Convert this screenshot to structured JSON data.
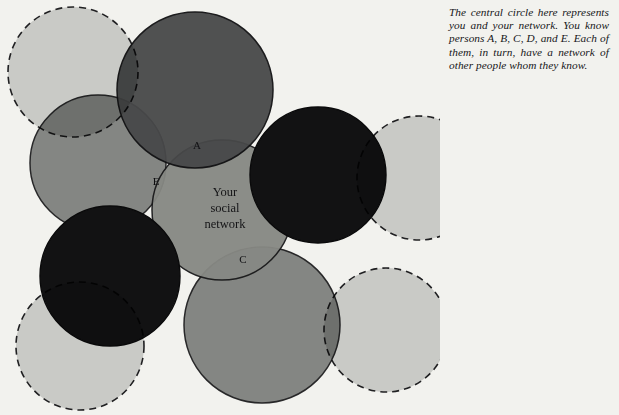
{
  "figure": {
    "caption": "The central circle here represents you and your network. You know persons A, B, C, D, and E. Each of them, in turn, have a network of other people whom they know.",
    "center_label_lines": [
      "Your",
      "social",
      "network"
    ],
    "background_color": "#f2f2ee"
  },
  "diagram": {
    "type": "venn-overlap-circles",
    "palette": {
      "light_gray": "#c9cac6",
      "medium_gray": "#838584",
      "dark_gray": "#4b4c4e",
      "black": "#121214",
      "outline": "#1a1a1c",
      "center_gray": "#8e908d"
    },
    "node_labels": [
      {
        "id": "A",
        "text": "A",
        "x": 197,
        "y": 149
      },
      {
        "id": "E",
        "text": "E",
        "x": 156,
        "y": 185
      },
      {
        "id": "C",
        "text": "C",
        "x": 243,
        "y": 263
      }
    ],
    "circles": [
      {
        "name": "outer-network-top-left",
        "cx": 73,
        "cy": 72,
        "r": 65,
        "fill": "light_gray",
        "stroke": "dashed"
      },
      {
        "name": "network-a",
        "cx": 195,
        "cy": 90,
        "r": 78,
        "fill": "dark_gray",
        "stroke": "solid"
      },
      {
        "name": "network-e",
        "cx": 98,
        "cy": 163,
        "r": 68,
        "fill": "medium_gray",
        "stroke": "solid"
      },
      {
        "name": "your-social-network",
        "cx": 222,
        "cy": 210,
        "r": 70,
        "fill": "center_gray",
        "stroke": "solid"
      },
      {
        "name": "network-b",
        "cx": 318,
        "cy": 175,
        "r": 68,
        "fill": "black",
        "stroke": "solid"
      },
      {
        "name": "network-d",
        "cx": 110,
        "cy": 276,
        "r": 70,
        "fill": "black",
        "stroke": "solid"
      },
      {
        "name": "network-c",
        "cx": 262,
        "cy": 325,
        "r": 78,
        "fill": "medium_gray",
        "stroke": "solid"
      },
      {
        "name": "outer-network-right",
        "cx": 419,
        "cy": 178,
        "r": 62,
        "fill": "light_gray",
        "stroke": "dashed"
      },
      {
        "name": "outer-network-bottom-right",
        "cx": 386,
        "cy": 330,
        "r": 62,
        "fill": "light_gray",
        "stroke": "dashed"
      },
      {
        "name": "outer-network-bottom-left",
        "cx": 80,
        "cy": 346,
        "r": 64,
        "fill": "light_gray",
        "stroke": "dashed"
      }
    ]
  }
}
